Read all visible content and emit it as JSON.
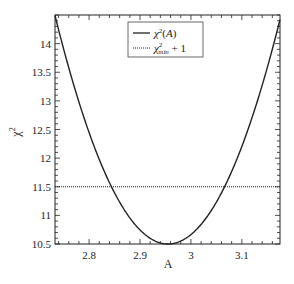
{
  "chart_data": {
    "type": "line",
    "title": "",
    "xlabel": "A",
    "ylabel": "χ²",
    "xlim": [
      2.733,
      3.175
    ],
    "ylim": [
      10.5,
      14.5
    ],
    "xticks": [
      2.8,
      2.9,
      3.0,
      3.1
    ],
    "xtick_labels": [
      "2.8",
      "2.9",
      "3",
      "3.1"
    ],
    "yticks": [
      10.5,
      11,
      11.5,
      12,
      12.5,
      13,
      13.5,
      14
    ],
    "ytick_labels": [
      "10.5",
      "11",
      "11.5",
      "12",
      "12.5",
      "13",
      "13.5",
      "14"
    ],
    "legend_position": "top-right",
    "series": [
      {
        "name": "χ²(A)",
        "style": "solid",
        "model": "parabola",
        "min_x": 2.955,
        "min_y": 10.5,
        "curvature": 81,
        "x": [
          2.733,
          2.76,
          2.8,
          2.844,
          2.9,
          2.955,
          3.0,
          3.066,
          3.1,
          3.15,
          3.175
        ],
        "y": [
          14.49,
          13.58,
          12.45,
          11.5,
          10.75,
          10.5,
          10.66,
          11.5,
          12.2,
          13.58,
          14.42
        ]
      },
      {
        "name": "χ²min + 1",
        "style": "dotted",
        "constant": 11.5
      }
    ]
  }
}
